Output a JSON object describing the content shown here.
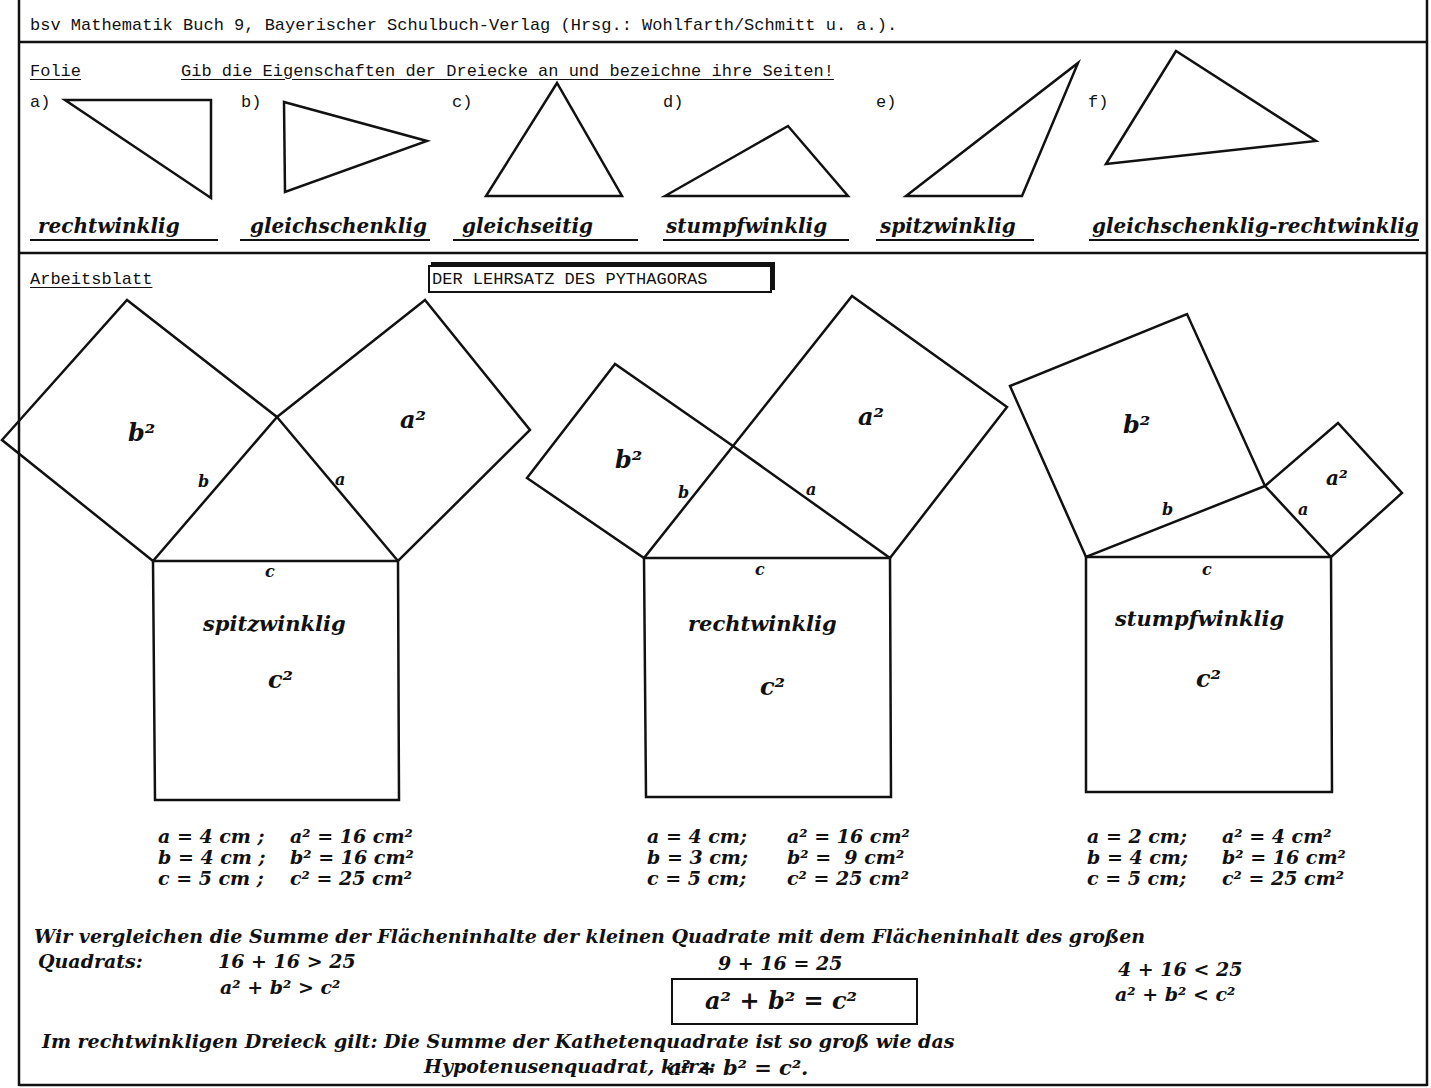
{
  "header": {
    "source": "bsv Mathematik Buch 9, Bayerischer Schulbuch-Verlag (Hrsg.: Wohlfarth/Schmitt u. a.)."
  },
  "folie": {
    "label": "Folie",
    "task": "Gib die Eigenschaften der Dreiecke an und bezeichne ihre Seiten!",
    "triangles": [
      {
        "letter": "a)",
        "property": "rechtwinklig"
      },
      {
        "letter": "b)",
        "property": "gleichschenklig"
      },
      {
        "letter": "c)",
        "property": "gleichseitig"
      },
      {
        "letter": "d)",
        "property": "stumpfwinklig"
      },
      {
        "letter": "e)",
        "property": "spitzwinklig"
      },
      {
        "letter": "f)",
        "property": "gleichschenklig-rechtwinklig"
      }
    ]
  },
  "arbeitsblatt": {
    "label": "Arbeitsblatt",
    "title": "DER LEHRSATZ DES PYTHAGORAS",
    "figures": [
      {
        "type": "spitzwinklig",
        "labels": {
          "a_sq": "a²",
          "b_sq": "b²",
          "c_sq": "c²",
          "a": "a",
          "b": "b",
          "c": "c"
        },
        "values": [
          "a = 4 cm ;",
          "b = 4 cm ;",
          "c = 5 cm ;"
        ],
        "squares": [
          "a² = 16 cm²",
          "b² = 16 cm²",
          "c² = 25 cm²"
        ],
        "comparison": "16 + 16  > 25",
        "relation": "a² + b²  >  c²"
      },
      {
        "type": "rechtwinklig",
        "labels": {
          "a_sq": "a²",
          "b_sq": "b²",
          "c_sq": "c²",
          "a": "a",
          "b": "b",
          "c": "c"
        },
        "values": [
          "a = 4 cm;",
          "b = 3 cm;",
          "c = 5 cm;"
        ],
        "squares": [
          "a² = 16 cm²",
          "b² =  9 cm²",
          "c² = 25 cm²"
        ],
        "comparison": "9 + 16  = 25",
        "relation": "a² + b²  =  c²"
      },
      {
        "type": "stumpfwinklig",
        "labels": {
          "a_sq": "a²",
          "b_sq": "b²",
          "c_sq": "c²",
          "a": "a",
          "b": "b",
          "c": "c"
        },
        "values": [
          "a = 2 cm;",
          "b = 4 cm;",
          "c = 5 cm;"
        ],
        "squares": [
          "a² = 4 cm²",
          "b² = 16 cm²",
          "c² = 25 cm²"
        ],
        "comparison": "4 + 16  < 25",
        "relation": "a² + b²  <  c²"
      }
    ],
    "compare_text_1": "Wir vergleichen die Summe der Flächeninhalte der kleinen Quadrate mit dem Flächeninhalt des großen",
    "compare_text_2": "Quadrats:",
    "conclusion_1": "Im rechtwinkligen Dreieck gilt:  Die Summe der Kathetenquadrate ist so groß wie das",
    "conclusion_2": "Hypotenusenquadrat, kurz:",
    "conclusion_formula": "a² + b² = c²."
  }
}
